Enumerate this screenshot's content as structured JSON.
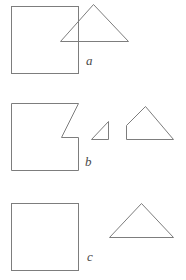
{
  "figure": {
    "background_color": "#ffffff",
    "stroke_color": "#7d7d7d",
    "stroke_width": 1,
    "width": 186,
    "height": 280
  },
  "panels": [
    {
      "id": "a",
      "label": "a",
      "label_position": {
        "x": 86,
        "y": 54
      },
      "shapes": [
        {
          "name": "square",
          "type": "rect",
          "x": 11,
          "y": 6,
          "width": 67,
          "height": 67
        },
        {
          "name": "triangle",
          "type": "polygon",
          "points": "93,4 128,41 60,41"
        }
      ]
    },
    {
      "id": "b",
      "label": "b",
      "label_position": {
        "x": 85,
        "y": 155
      },
      "shapes": [
        {
          "name": "notched-square",
          "type": "polygon",
          "points": "11,103 78,103 61,137 78,137 78,170 11,170"
        },
        {
          "name": "small-triangle",
          "type": "polygon",
          "points": "108,121 108,139 91,139"
        },
        {
          "name": "truncated-triangle",
          "type": "polygon",
          "points": "145,106 173,139 126,139 126,125"
        }
      ]
    },
    {
      "id": "c",
      "label": "c",
      "label_position": {
        "x": 87,
        "y": 250
      },
      "shapes": [
        {
          "name": "square",
          "type": "rect",
          "x": 11,
          "y": 203,
          "width": 67,
          "height": 67
        },
        {
          "name": "triangle",
          "type": "polygon",
          "points": "141,203 173,237 109,237"
        }
      ]
    }
  ]
}
